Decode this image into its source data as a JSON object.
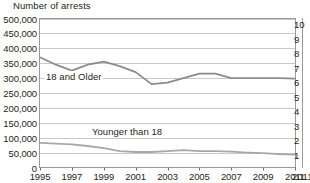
{
  "chart_data": {
    "type": "line",
    "title": "Number of arrests",
    "xlabel": "",
    "ylabel": "Number of arrests",
    "x": [
      1995,
      1996,
      1997,
      1998,
      1999,
      2000,
      2001,
      2002,
      2003,
      2004,
      2005,
      2006,
      2007,
      2008,
      2009,
      2010,
      2011
    ],
    "xlim": [
      1995,
      2011
    ],
    "ylim": [
      0,
      500000
    ],
    "ytick_labels": [
      "500,000",
      "450,000",
      "400,000",
      "350,000",
      "300,000",
      "250,000",
      "200,000",
      "150,000",
      "100,000",
      "50,000",
      "0"
    ],
    "ytick_values": [
      500000,
      450000,
      400000,
      350000,
      300000,
      250000,
      200000,
      150000,
      100000,
      50000,
      0
    ],
    "xtick_labels": [
      "1995",
      "1997",
      "1999",
      "2001",
      "2003",
      "2005",
      "2007",
      "2009",
      "2011"
    ],
    "xtick_values": [
      1995,
      1997,
      1999,
      2001,
      2003,
      2005,
      2007,
      2009,
      2011
    ],
    "grid": true,
    "legend_position": "inline-annotation",
    "series": [
      {
        "name": "18 and Older",
        "color": "#8c8c8c",
        "values": [
          370000,
          345000,
          325000,
          345000,
          355000,
          340000,
          320000,
          280000,
          285000,
          300000,
          315000,
          315000,
          300000,
          300000,
          300000,
          300000,
          298000
        ]
      },
      {
        "name": "Younger than 18",
        "color": "#a8a8a8",
        "values": [
          83000,
          80000,
          78000,
          72000,
          65000,
          55000,
          52000,
          52000,
          55000,
          58000,
          55000,
          55000,
          53000,
          50000,
          48000,
          45000,
          43000
        ]
      }
    ],
    "annotations": [
      {
        "text": "18 and Older",
        "series": "18 and Older"
      },
      {
        "text": "Younger than 18",
        "series": "Younger than 18"
      }
    ]
  },
  "right_partial_chart": {
    "ytick_labels": [
      "10",
      "9",
      "8",
      "7",
      "6",
      "5",
      "4",
      "3",
      "2",
      "1"
    ],
    "xtick_label": "2011"
  }
}
